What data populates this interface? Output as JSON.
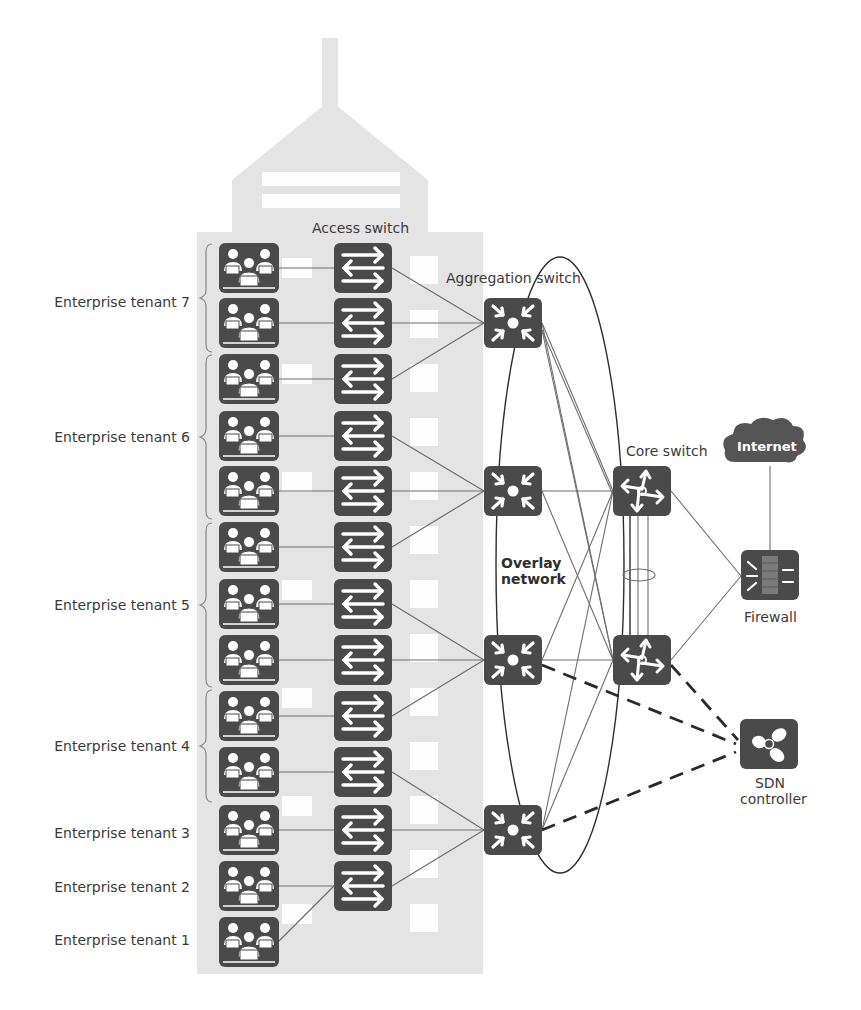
{
  "diagram": {
    "labels": {
      "access_switch": "Access switch",
      "aggregation_switch": "Aggregation switch",
      "core_switch": "Core switch",
      "internet": "Internet",
      "firewall": "Firewall",
      "sdn_controller_line1": "SDN",
      "sdn_controller_line2": "controller",
      "overlay_line1": "Overlay",
      "overlay_line2": "network"
    },
    "tenants": [
      {
        "label": "Enterprise tenant 7",
        "y": 302
      },
      {
        "label": "Enterprise tenant 6",
        "y": 437
      },
      {
        "label": "Enterprise tenant 5",
        "y": 605
      },
      {
        "label": "Enterprise tenant 4",
        "y": 746
      },
      {
        "label": "Enterprise tenant 3",
        "y": 833
      },
      {
        "label": "Enterprise tenant 2",
        "y": 887
      },
      {
        "label": "Enterprise tenant 1",
        "y": 940
      }
    ],
    "colors": {
      "building": "#e4e4e4",
      "window": "#ffffff",
      "device": "#4a4a4a",
      "device_glyph": "#ffffff",
      "link": "#6e6e6e",
      "text": "#3a3a3a"
    }
  }
}
